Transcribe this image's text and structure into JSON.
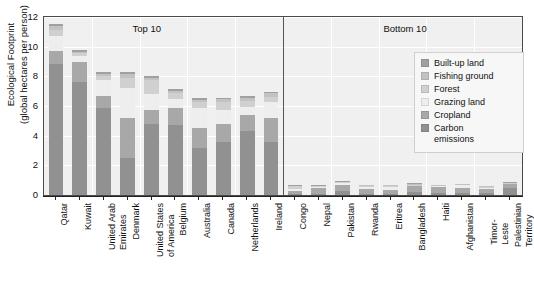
{
  "chart_data": {
    "type": "bar",
    "subtype": "stacked-bar",
    "title": "",
    "xlabel": "",
    "ylabel": "Ecological Footprint\n(global hectares per person)",
    "ylim": [
      0,
      12
    ],
    "yticks": [
      0,
      2,
      4,
      6,
      8,
      10,
      12
    ],
    "grid": true,
    "legend_position": "right-inside",
    "panels": [
      {
        "label": "Top 10",
        "start_index": 0,
        "end_index": 9
      },
      {
        "label": "Bottom 10",
        "start_index": 10,
        "end_index": 19
      }
    ],
    "categories": [
      "Qatar",
      "Kuwait",
      "United Arab\nEmirates",
      "Denmark",
      "United States\nof America",
      "Belgium",
      "Australia",
      "Canada",
      "Netherlands",
      "Ireland",
      "Congo",
      "Nepal",
      "Pakistan",
      "Rwanda",
      "Eritrea",
      "Bangladesh",
      "Haiti",
      "Afghanistan",
      "Timor-Leste",
      "Palestinian\nTerritory"
    ],
    "series": [
      {
        "name": "Carbon emissions",
        "color": "#919191",
        "values": [
          8.8,
          7.6,
          5.9,
          2.5,
          4.8,
          4.7,
          3.2,
          3.6,
          4.3,
          3.6,
          0.06,
          0.06,
          0.28,
          0.06,
          0.1,
          0.22,
          0.16,
          0.12,
          0.14,
          0.5
        ]
      },
      {
        "name": "Cropland",
        "color": "#a8a8a8",
        "values": [
          0.9,
          1.4,
          0.75,
          2.7,
          0.95,
          1.15,
          1.35,
          1.2,
          1.1,
          1.6,
          0.2,
          0.4,
          0.42,
          0.36,
          0.26,
          0.36,
          0.38,
          0.36,
          0.3,
          0.22
        ]
      },
      {
        "name": "Grazing land",
        "color": "#eeeeee",
        "values": [
          1.0,
          0.35,
          1.1,
          2.0,
          1.05,
          0.6,
          1.35,
          0.95,
          0.55,
          1.1,
          0.12,
          0.06,
          0.1,
          0.12,
          0.16,
          0.04,
          0.05,
          0.18,
          0.05,
          0.05
        ]
      },
      {
        "name": "Forest",
        "color": "#d0d0d0",
        "values": [
          0.45,
          0.2,
          0.3,
          0.7,
          0.95,
          0.45,
          0.4,
          0.55,
          0.4,
          0.3,
          0.22,
          0.1,
          0.08,
          0.1,
          0.07,
          0.06,
          0.05,
          0.05,
          0.06,
          0.05
        ]
      },
      {
        "name": "Fishing ground",
        "color": "#c2c2c2",
        "values": [
          0.25,
          0.12,
          0.12,
          0.25,
          0.15,
          0.1,
          0.12,
          0.15,
          0.2,
          0.25,
          0.03,
          0.01,
          0.02,
          0.01,
          0.08,
          0.05,
          0.03,
          0.01,
          0.05,
          0.02
        ]
      },
      {
        "name": "Built-up land",
        "color": "#a0a0a0",
        "values": [
          0.1,
          0.08,
          0.12,
          0.15,
          0.1,
          0.12,
          0.1,
          0.1,
          0.15,
          0.12,
          0.02,
          0.03,
          0.05,
          0.03,
          0.02,
          0.06,
          0.04,
          0.03,
          0.03,
          0.03
        ]
      }
    ],
    "legend_entries": [
      {
        "label": "Built-up land",
        "color": "#a0a0a0"
      },
      {
        "label": "Fishing ground",
        "color": "#c2c2c2"
      },
      {
        "label": "Forest",
        "color": "#d0d0d0"
      },
      {
        "label": "Grazing land",
        "color": "#eeeeee"
      },
      {
        "label": "Cropland",
        "color": "#a8a8a8"
      },
      {
        "label": "Carbon\nemissions",
        "color": "#919191"
      }
    ]
  }
}
